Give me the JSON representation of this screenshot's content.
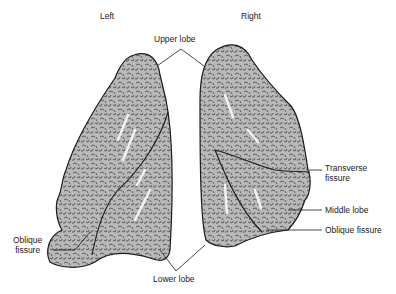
{
  "diagram": {
    "type": "anatomical-illustration",
    "side_labels": {
      "left": "Left",
      "right": "Right"
    },
    "labels": {
      "upper_lobe": "Upper lobe",
      "lower_lobe": "Lower lobe",
      "transverse_fissure_line1": "Transverse",
      "transverse_fissure_line2": "fissure",
      "middle_lobe": "Middle lobe",
      "oblique_fissure_right": "Oblique fissure",
      "oblique_fissure_left_line1": "Oblique",
      "oblique_fissure_left_line2": "fissure"
    },
    "colors": {
      "lung_fill": "#b8b8b8",
      "texture": "#3a3a3a",
      "outline": "#1a1a1a",
      "highlight": "#f2f2f2"
    }
  }
}
